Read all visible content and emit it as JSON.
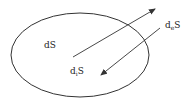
{
  "diagram": {
    "type": "entropy-balance",
    "stroke_color": "#333333",
    "system_boundary": {
      "shape": "ellipse",
      "cx": 80,
      "cy": 55,
      "rx": 69,
      "ry": 42
    },
    "labels": {
      "total": {
        "main": "dS",
        "d": "d",
        "sub": "",
        "var": "S"
      },
      "internal": {
        "d": "d",
        "sub": "i",
        "var": "S"
      },
      "external": {
        "d": "d",
        "sub": "e",
        "var": "S"
      }
    },
    "arrows": [
      {
        "name": "outward",
        "x1": 73,
        "y1": 57,
        "x2": 155,
        "y2": 9
      },
      {
        "name": "inward",
        "x1": 160,
        "y1": 28,
        "x2": 101,
        "y2": 75
      }
    ]
  }
}
